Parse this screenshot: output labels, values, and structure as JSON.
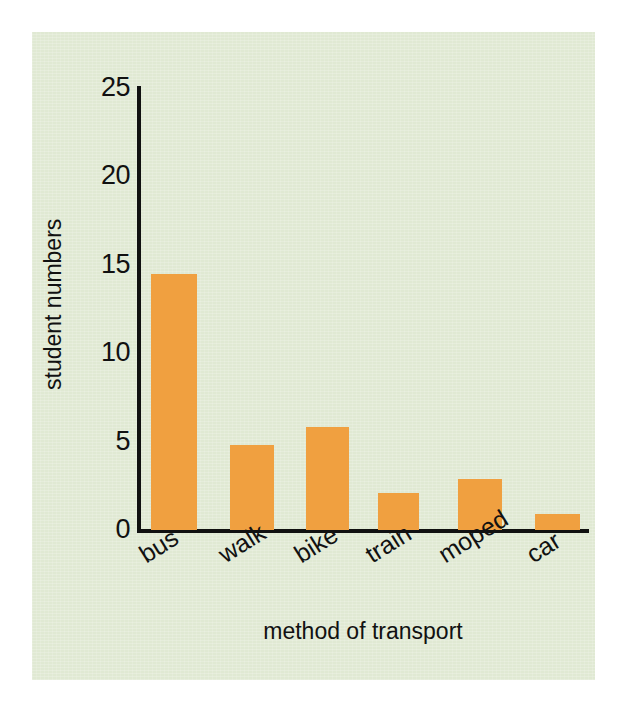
{
  "figure": {
    "background_color": "#ffffff",
    "panel_color": "#e0e9d3",
    "bar_color": "#f0a040",
    "axis_color": "#111111"
  },
  "chart_data": {
    "type": "bar",
    "title": "",
    "xlabel": "method of transport",
    "ylabel": "student numbers",
    "categories": [
      "bus",
      "walk",
      "bike",
      "train",
      "moped",
      "car"
    ],
    "values": [
      14.5,
      4.8,
      5.8,
      2.1,
      2.9,
      0.9
    ],
    "ylim": [
      0,
      25
    ],
    "yticks": [
      0,
      5,
      10,
      15,
      20,
      25
    ],
    "ytick_labels": [
      "0",
      "5",
      "10",
      "15",
      "20",
      "25"
    ],
    "grid": false,
    "legend": false,
    "bar_color": "#f0a040",
    "series": [
      {
        "name": "student numbers",
        "values": [
          14.5,
          4.8,
          5.8,
          2.1,
          2.9,
          0.9
        ]
      }
    ]
  }
}
